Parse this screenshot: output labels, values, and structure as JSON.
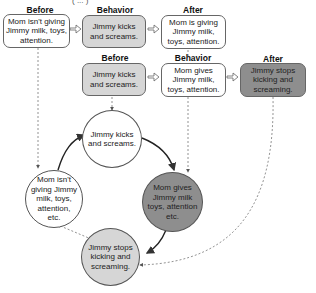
{
  "diagram": {
    "title_partial": "( ... )",
    "top_row": {
      "before": {
        "header": "Before",
        "text": "Mom isn't giving Jimmy milk, toys, attention."
      },
      "behavior": {
        "header": "Behavior",
        "text": "Jimmy kicks and screams."
      },
      "after": {
        "header": "After",
        "text": "Mom is giving Jimmy milk, toys, attention."
      }
    },
    "second_row": {
      "before": {
        "header": "Before",
        "text": "Jimmy kicks and screams."
      },
      "behavior": {
        "header": "Behavior",
        "text": "Mom gives Jimmy milk, toys, attention."
      },
      "after": {
        "header": "After",
        "text": "Jimmy stops kicking and screaming."
      }
    },
    "cycle": {
      "top": "Jimmy kicks and screams.",
      "right": "Mom gives Jimmy milk toys, attention etc.",
      "bottom": "Jimmy stops kicking and screaming.",
      "left": "Mom isn't giving Jimmy milk, toys, attention, etc."
    },
    "colors": {
      "white_fill": "#ffffff",
      "light_fill": "#d6d6d6",
      "dark_fill": "#8e8e8e",
      "stroke": "#555555"
    }
  }
}
